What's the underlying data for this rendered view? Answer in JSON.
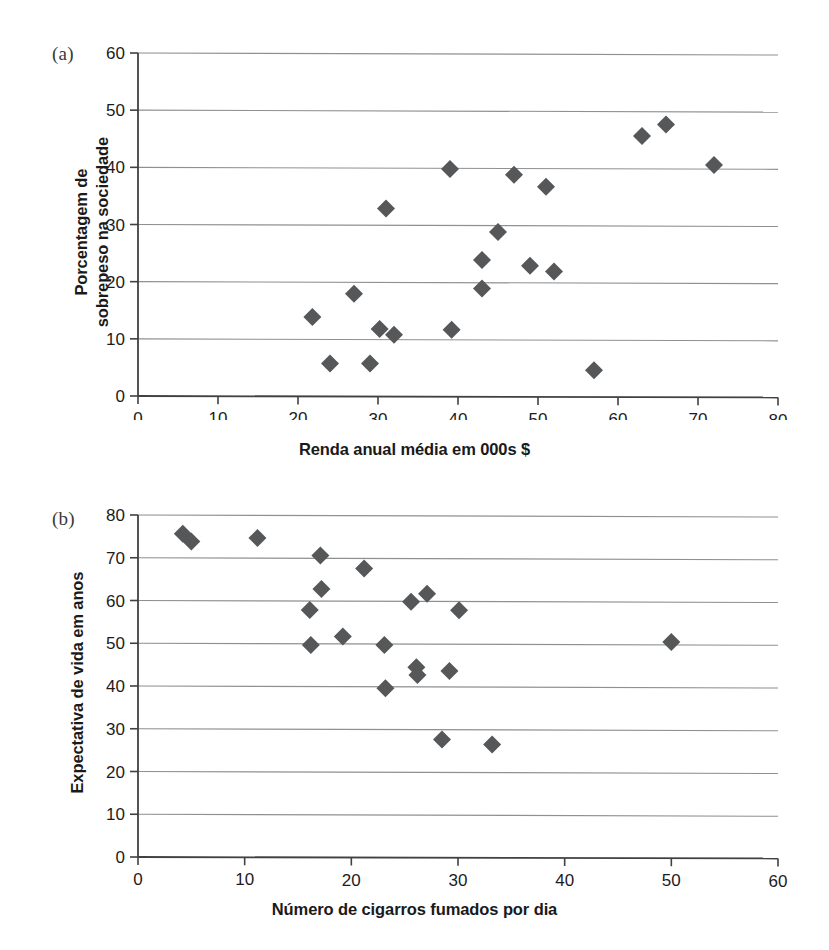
{
  "figure": {
    "background_color": "#ffffff",
    "marker_color": "#555758",
    "gridline_color": "#8e9091",
    "axis_color": "#3f4142"
  },
  "panels": [
    {
      "id": "a",
      "letter": "(a)",
      "chart_data": {
        "type": "scatter",
        "title": "",
        "xlabel": "Renda anual média em 000s $",
        "ylabel": "Porcentagem de\nsobrepeso na sociedade",
        "ylabel_lines": [
          "Porcentagem de",
          "sobrepeso na sociedade"
        ],
        "xlim": [
          0,
          80
        ],
        "ylim": [
          0,
          60
        ],
        "xticks": [
          0,
          10,
          20,
          30,
          40,
          50,
          60,
          70,
          80
        ],
        "yticks": [
          0,
          10,
          20,
          30,
          40,
          50,
          60
        ],
        "xtick_labels": [
          "0",
          "10",
          "20",
          "30",
          "40",
          "50",
          "60",
          "70",
          "80"
        ],
        "ytick_labels": [
          "0",
          "10",
          "20",
          "30",
          "40",
          "50",
          "60"
        ],
        "grid": "horizontal",
        "legend": "none",
        "marker": "diamond",
        "points": [
          {
            "x": 21.8,
            "y": 13.8
          },
          {
            "x": 24.0,
            "y": 5.7
          },
          {
            "x": 27.0,
            "y": 17.9
          },
          {
            "x": 29.0,
            "y": 5.7
          },
          {
            "x": 30.2,
            "y": 11.7
          },
          {
            "x": 31.0,
            "y": 32.8
          },
          {
            "x": 32.0,
            "y": 10.7
          },
          {
            "x": 39.0,
            "y": 39.7
          },
          {
            "x": 39.2,
            "y": 11.6
          },
          {
            "x": 43.0,
            "y": 23.8
          },
          {
            "x": 43.0,
            "y": 18.8
          },
          {
            "x": 45.0,
            "y": 28.7
          },
          {
            "x": 47.0,
            "y": 38.7
          },
          {
            "x": 49.0,
            "y": 22.8
          },
          {
            "x": 51.0,
            "y": 36.6
          },
          {
            "x": 52.0,
            "y": 21.8
          },
          {
            "x": 57.0,
            "y": 4.5
          },
          {
            "x": 63.0,
            "y": 45.5
          },
          {
            "x": 66.0,
            "y": 47.5
          },
          {
            "x": 72.0,
            "y": 40.4
          }
        ]
      }
    },
    {
      "id": "b",
      "letter": "(b)",
      "chart_data": {
        "type": "scatter",
        "title": "",
        "xlabel": "Número de cigarros fumados por dia",
        "ylabel": "Expectativa de vida em anos",
        "ylabel_lines": [
          "Expectativa de vida em anos"
        ],
        "xlim": [
          0,
          60
        ],
        "ylim": [
          0,
          80
        ],
        "xticks": [
          0,
          10,
          20,
          30,
          40,
          50,
          60
        ],
        "yticks": [
          0,
          10,
          20,
          30,
          40,
          50,
          60,
          70,
          80
        ],
        "xtick_labels": [
          "0",
          "10",
          "20",
          "30",
          "40",
          "50",
          "60"
        ],
        "ytick_labels": [
          "0",
          "10",
          "20",
          "30",
          "40",
          "50",
          "60",
          "70",
          "80"
        ],
        "grid": "horizontal",
        "legend": "none",
        "marker": "diamond",
        "points": [
          {
            "x": 4.2,
            "y": 75.6
          },
          {
            "x": 5.0,
            "y": 73.8
          },
          {
            "x": 11.2,
            "y": 74.6
          },
          {
            "x": 16.1,
            "y": 57.8
          },
          {
            "x": 16.2,
            "y": 49.6
          },
          {
            "x": 17.1,
            "y": 70.5
          },
          {
            "x": 17.2,
            "y": 62.7
          },
          {
            "x": 19.2,
            "y": 51.6
          },
          {
            "x": 21.2,
            "y": 67.5
          },
          {
            "x": 23.1,
            "y": 49.6
          },
          {
            "x": 23.2,
            "y": 39.5
          },
          {
            "x": 25.6,
            "y": 59.7
          },
          {
            "x": 26.1,
            "y": 44.4
          },
          {
            "x": 26.2,
            "y": 42.6
          },
          {
            "x": 27.1,
            "y": 61.6
          },
          {
            "x": 28.5,
            "y": 27.5
          },
          {
            "x": 29.2,
            "y": 43.5
          },
          {
            "x": 30.1,
            "y": 57.7
          },
          {
            "x": 33.2,
            "y": 26.3
          },
          {
            "x": 50.0,
            "y": 50.3
          }
        ]
      }
    }
  ]
}
